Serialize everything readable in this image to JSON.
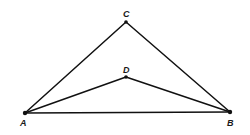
{
  "diagram": {
    "type": "geometry-figure",
    "points": [
      {
        "id": "A",
        "label": "A",
        "x": 25,
        "y": 113,
        "lx": 22,
        "ly": 125
      },
      {
        "id": "B",
        "label": "B",
        "x": 230,
        "y": 112,
        "lx": 229,
        "ly": 125
      },
      {
        "id": "C",
        "label": "C",
        "x": 126,
        "y": 22,
        "lx": 123,
        "ly": 17
      },
      {
        "id": "D",
        "label": "D",
        "x": 126,
        "y": 77,
        "lx": 123,
        "ly": 72
      }
    ],
    "segments": [
      {
        "from": "A",
        "to": "B"
      },
      {
        "from": "A",
        "to": "C"
      },
      {
        "from": "C",
        "to": "B"
      },
      {
        "from": "A",
        "to": "D"
      },
      {
        "from": "D",
        "to": "B"
      }
    ],
    "colors": {
      "stroke": "#111111",
      "background": "#ffffff"
    }
  }
}
